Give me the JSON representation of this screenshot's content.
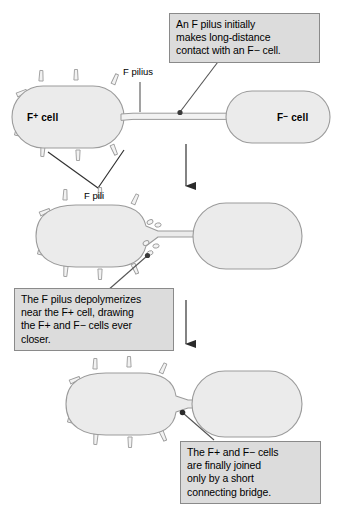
{
  "figure": {
    "background_color": "#ffffff",
    "cell_fill_color": "#ebebeb",
    "cell_stroke_color": "#9b9b9b",
    "callout_fill_color": "#dcdcdc",
    "callout_stroke_color": "#8a8a8a",
    "arrow_color": "#6e6e6e",
    "arrow_head_color": "#2b2b2b",
    "leader_color": "#555555"
  },
  "labels": {
    "f_plus_cell": "F+ cell",
    "f_minus_cell": "F− cell",
    "f_pilius": "F pilius",
    "f_pili": "F pili"
  },
  "callouts": [
    {
      "id": "callout-long-distance-contact",
      "lines": [
        "An F pilus initially",
        "makes long-distance",
        "contact with an F− cell."
      ]
    },
    {
      "id": "callout-depolymerizes",
      "lines": [
        "The F pilus depolymerizes",
        "near the F+ cell, drawing",
        "the F+ and F− cells ever",
        "closer."
      ]
    },
    {
      "id": "callout-connecting-bridge",
      "lines": [
        "The F+ and F− cells",
        "are finally joined",
        "only by a short",
        "connecting bridge."
      ]
    }
  ],
  "panels": [
    {
      "id": "panel-1-long-pilus",
      "stage": 1,
      "description": "F+ cell with many pili connected to distant F− cell by a long thin F pilus"
    },
    {
      "id": "panel-2-retracting",
      "stage": 2,
      "description": "Pilus shortening, depolymerized subunits shed near the F+ cell, cells drawn closer"
    },
    {
      "id": "panel-3-bridge",
      "stage": 3,
      "description": "Cells joined by a short connecting bridge"
    }
  ],
  "arrows": [
    {
      "id": "arrow-stage-1-to-2"
    },
    {
      "id": "arrow-stage-2-to-3"
    }
  ]
}
